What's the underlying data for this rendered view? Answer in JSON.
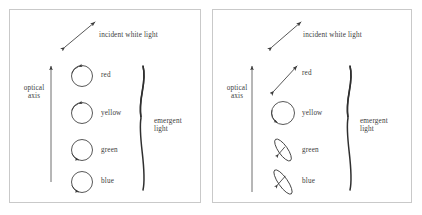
{
  "figure": {
    "panels": [
      {
        "id": "left",
        "incident_label": "incident white light",
        "axis_label_line1": "optical",
        "axis_label_line2": "axis",
        "emergent_label_line1": "emergent",
        "emergent_label_line2": "light",
        "components": [
          {
            "color_name": "red",
            "shape": "circle",
            "rotation": "counterclockwise"
          },
          {
            "color_name": "yellow",
            "shape": "circle",
            "rotation": "counterclockwise"
          },
          {
            "color_name": "green",
            "shape": "circle",
            "rotation": "clockwise"
          },
          {
            "color_name": "blue",
            "shape": "circle",
            "rotation": "clockwise"
          }
        ]
      },
      {
        "id": "right",
        "incident_label": "incident white light",
        "axis_label_line1": "optical",
        "axis_label_line2": "axis",
        "emergent_label_line1": "emergent",
        "emergent_label_line2": "light",
        "components": [
          {
            "color_name": "red",
            "shape": "linear-double-arrow",
            "rotation": "none"
          },
          {
            "color_name": "yellow",
            "shape": "circle",
            "rotation": "counterclockwise"
          },
          {
            "color_name": "green",
            "shape": "narrow-ellipse",
            "rotation": "counterclockwise"
          },
          {
            "color_name": "blue",
            "shape": "narrow-ellipse",
            "rotation": "counterclockwise"
          }
        ]
      }
    ]
  },
  "colors": {
    "ink": "#3a3a3a",
    "border": "#c9c9c9",
    "background": "#ffffff"
  }
}
